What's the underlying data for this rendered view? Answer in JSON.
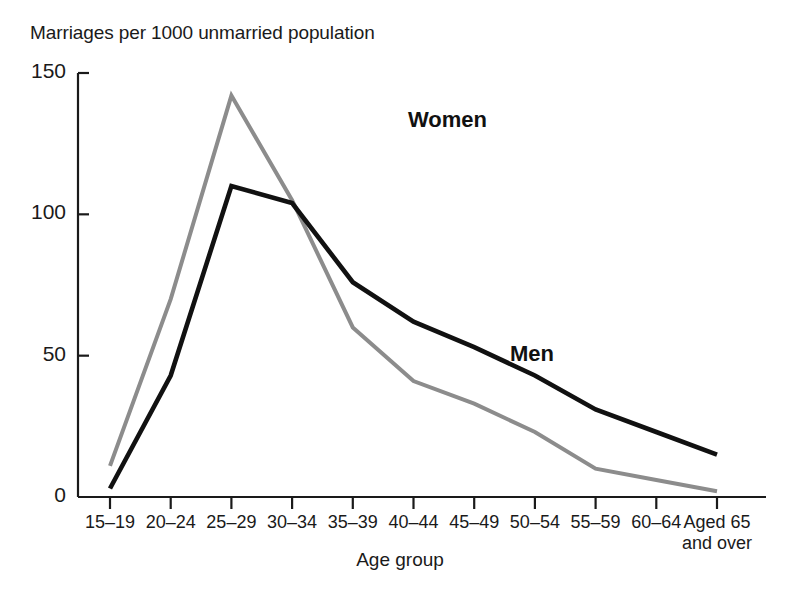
{
  "chart_data": {
    "type": "line",
    "title": "Marriages per 1000 unmarried population",
    "xlabel": "Age group",
    "ylabel": "",
    "categories": [
      "15–19",
      "20–24",
      "25–29",
      "30–34",
      "35–39",
      "40–44",
      "45–49",
      "50–54",
      "55–59",
      "60–64",
      "Aged 65 and over"
    ],
    "category_lines": [
      [
        "15–19"
      ],
      [
        "20–24"
      ],
      [
        "25–29"
      ],
      [
        "30–34"
      ],
      [
        "35–39"
      ],
      [
        "40–44"
      ],
      [
        "45–49"
      ],
      [
        "50–54"
      ],
      [
        "55–59"
      ],
      [
        "60–64"
      ],
      [
        "Aged 65",
        "and over"
      ]
    ],
    "series": [
      {
        "name": "Women",
        "color": "#8c8c8c",
        "values": [
          11,
          70,
          142,
          105,
          60,
          41,
          33,
          23,
          10,
          6,
          2
        ]
      },
      {
        "name": "Men",
        "color": "#111111",
        "values": [
          3,
          43,
          110,
          104,
          76,
          62,
          53,
          43,
          31,
          23,
          15
        ]
      }
    ],
    "ylim": [
      0,
      150
    ],
    "yticks": [
      0,
      50,
      100,
      150
    ],
    "ytick_labels": [
      "0",
      "50",
      "100",
      "150"
    ],
    "grid": false,
    "legend": "inline-annotations",
    "annotations": [
      {
        "text": "Women",
        "x_px": 458,
        "y_px": 123
      },
      {
        "text": "Men",
        "x_px": 560,
        "y_px": 357
      }
    ]
  },
  "axis_colors": {
    "axis_line": "#1a1a1a",
    "women_line": "#8c8c8c",
    "men_line": "#111111"
  }
}
